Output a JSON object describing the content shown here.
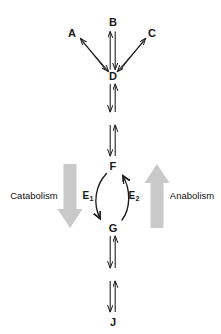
{
  "diagram": {
    "canvas": {
      "width": 221,
      "height": 334,
      "background": "#ffffff"
    },
    "colors": {
      "arrow_black": "#1a1a1a",
      "arrow_gray": "#c9c9c9",
      "label_text": "#1a1a1a",
      "process_text": "#111111"
    },
    "metabolites": [
      {
        "id": "A",
        "label": "A",
        "x": 72,
        "y": 33
      },
      {
        "id": "B",
        "label": "B",
        "x": 113,
        "y": 22
      },
      {
        "id": "C",
        "label": "C",
        "x": 152,
        "y": 33
      },
      {
        "id": "D",
        "label": "D",
        "x": 113,
        "y": 76
      },
      {
        "id": "F",
        "label": "F",
        "x": 113,
        "y": 166
      },
      {
        "id": "G",
        "label": "G",
        "x": 113,
        "y": 228
      },
      {
        "id": "J",
        "label": "J",
        "x": 113,
        "y": 322
      }
    ],
    "enzymes": [
      {
        "id": "E1",
        "base": "E",
        "subscript": "1",
        "x": 88,
        "y": 196,
        "direction": "F-to-G",
        "side": "left"
      },
      {
        "id": "E2",
        "base": "E",
        "subscript": "2",
        "x": 134,
        "y": 196,
        "direction": "G-to-F",
        "side": "right"
      }
    ],
    "processes": [
      {
        "id": "catabolism",
        "label": "Catabolism",
        "text_x": 34,
        "text_y": 196,
        "arrow_direction": "down",
        "arrow_color": "#c9c9c9",
        "arrow_x": 70,
        "arrow_top": 164,
        "arrow_bottom": 228
      },
      {
        "id": "anabolism",
        "label": "Anabolism",
        "text_x": 192,
        "text_y": 196,
        "arrow_direction": "up",
        "arrow_color": "#c9c9c9",
        "arrow_x": 157,
        "arrow_top": 164,
        "arrow_bottom": 228
      }
    ],
    "reactions": [
      {
        "id": "A-D",
        "from": "A",
        "to": "D",
        "reversible": true
      },
      {
        "id": "B-D",
        "from": "B",
        "to": "D",
        "reversible": true
      },
      {
        "id": "C-D",
        "from": "C",
        "to": "D",
        "reversible": true
      },
      {
        "id": "D-E",
        "from": "D",
        "to": "intermediate-1",
        "reversible": true
      },
      {
        "id": "E-F",
        "from": "intermediate-1",
        "to": "F",
        "reversible": true
      },
      {
        "id": "F-G",
        "from": "F",
        "to": "G",
        "reversible": true,
        "enzyme_forward": "E1",
        "enzyme_reverse": "E2"
      },
      {
        "id": "G-H",
        "from": "G",
        "to": "intermediate-2",
        "reversible": true
      },
      {
        "id": "H-J",
        "from": "intermediate-2",
        "to": "J",
        "reversible": true
      }
    ]
  }
}
